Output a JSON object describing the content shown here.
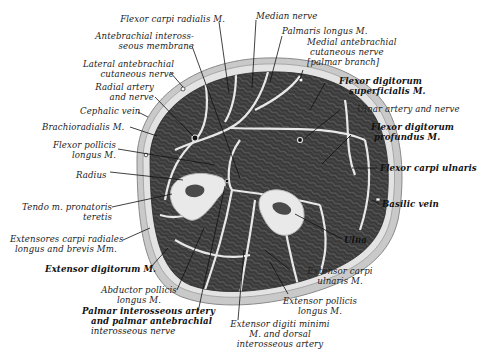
{
  "figure": {
    "colors": {
      "background": "#ffffff",
      "skin": "#c9c9c9",
      "subcutaneous": "#e6e6e6",
      "muscle": "#3a3a3a",
      "muscle_texture": "#6a6a6a",
      "fascia": "#e8e8e8",
      "bone": "#e9e9e9",
      "marrow": "#4a4a4a",
      "leader_line": "#111111",
      "label_text": "#222222"
    }
  },
  "labels": {
    "flexor_carpi_radialis": "Flexor carpi radialis M.",
    "median_nerve": "Median nerve",
    "palmaris_longus": "Palmaris longus M.",
    "antebrachial_interosseous_membrane": [
      "Antebrachial inteross-",
      "seous membrane"
    ],
    "medial_antebrachial_cutaneous_nerve": [
      "Medial antebrachial",
      "cutaneous nerve",
      "[palmar branch]"
    ],
    "lateral_antebrachial_cutaneous_nerve": [
      "Lateral antebrachial",
      "cutaneous nerve"
    ],
    "flexor_digitorum_superficialis": [
      "Flexor digitorum",
      "superficialis M."
    ],
    "radial_artery_and_nerve": [
      "Radial artery",
      "and nerve"
    ],
    "cephalic_vein": "Cephalic vein",
    "ulnar_artery_and_nerve": "Ulnar artery and nerve",
    "brachioradialis": "Brachioradialis M.",
    "flexor_digitorum_profundus": [
      "Flexor digitorum",
      "profundus M."
    ],
    "flexor_pollicis_longus": [
      "Flexor pollicis",
      "longus M."
    ],
    "flexor_carpi_ulnaris": "Flexor carpi ulnaris",
    "radius": "Radius",
    "basilic_vein": "Basilic vein",
    "tendo_pronatoris_teretis": [
      "Tendo m. pronatoris",
      "teretis"
    ],
    "ulna": "Ulna",
    "extensores_carpi_radiales": [
      "Extensores carpi radiales",
      "longus and brevis Mm."
    ],
    "extensor_digitorum": "Extensor digitorum M.",
    "extensor_carpi_ulnaris": [
      "Extensor carpi",
      "ulnaris M."
    ],
    "abductor_pollicis_longus": [
      "Abductor pollicis",
      "longus M."
    ],
    "extensor_pollicis_longus": [
      "Extensor pollicis",
      "longus M."
    ],
    "palmar_interosseous_artery": [
      "Palmar interosseous artery",
      "and palmar antebrachial",
      "interosseous nerve"
    ],
    "extensor_digiti_minimi": [
      "Extensor digiti minimi",
      "M. and dorsal",
      "interosseous artery"
    ]
  }
}
